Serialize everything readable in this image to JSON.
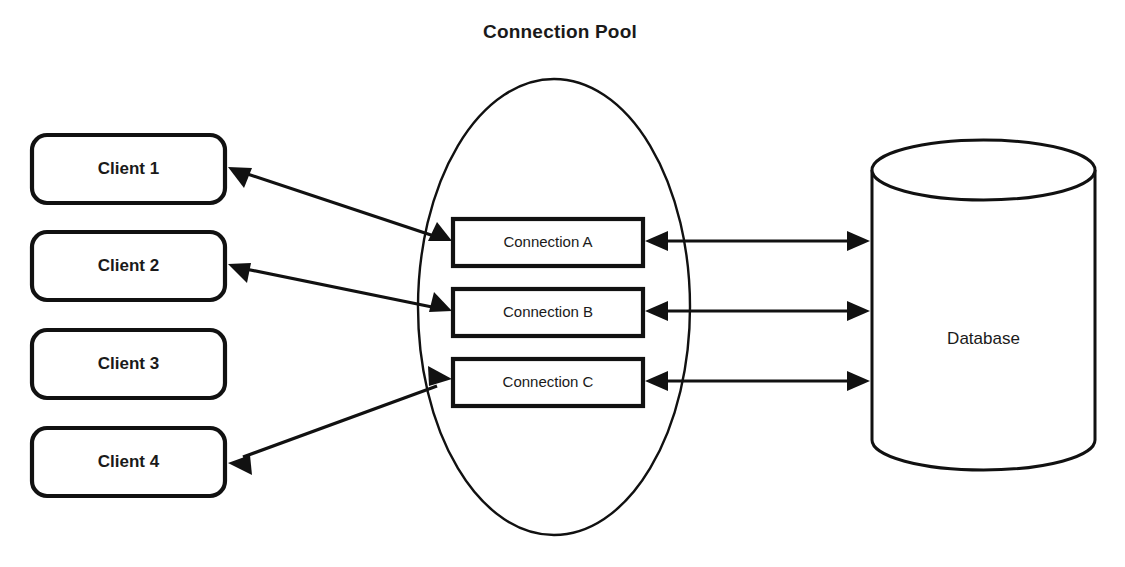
{
  "diagram": {
    "title": "Connection Pool",
    "title_position": {
      "x": 560,
      "y": 33
    },
    "canvas": {
      "width": 1125,
      "height": 567
    },
    "colors": {
      "background": "#ffffff",
      "stroke": "#111111",
      "text": "#1a1a1a"
    }
  },
  "clients": [
    {
      "label": "Client 1",
      "x": 32,
      "y": 135,
      "w": 193,
      "h": 68,
      "connected": true
    },
    {
      "label": "Client 2",
      "x": 32,
      "y": 232,
      "w": 193,
      "h": 68,
      "connected": true
    },
    {
      "label": "Client 3",
      "x": 32,
      "y": 330,
      "w": 193,
      "h": 68,
      "connected": false
    },
    {
      "label": "Client 4",
      "x": 32,
      "y": 428,
      "w": 193,
      "h": 68,
      "connected": true
    }
  ],
  "pool": {
    "label": "Connection Pool",
    "shape": "ellipse",
    "cx": 554,
    "cy": 307,
    "rx": 136,
    "ry": 228
  },
  "connections": [
    {
      "label": "Connection A",
      "x": 453,
      "y": 219,
      "w": 190,
      "h": 47
    },
    {
      "label": "Connection B",
      "x": 453,
      "y": 289,
      "w": 190,
      "h": 47
    },
    {
      "label": "Connection C",
      "x": 453,
      "y": 359,
      "w": 190,
      "h": 47
    }
  ],
  "database": {
    "label": "Database",
    "shape": "cylinder",
    "x": 872,
    "y": 170,
    "w": 223,
    "h": 300,
    "ellipse_ry": 30
  },
  "client_links": [
    {
      "from": "Client 1",
      "to": "Connection A",
      "style": "double-arrow",
      "x1": 228,
      "y1": 168,
      "x2": 450,
      "y2": 241
    },
    {
      "from": "Client 2",
      "to": "Connection B",
      "style": "double-arrow",
      "x1": 228,
      "y1": 265,
      "x2": 450,
      "y2": 311
    },
    {
      "from": "Client 4",
      "to": "Connection C",
      "style": "double-arrow",
      "x1": 228,
      "y1": 462,
      "x2": 450,
      "y2": 381
    }
  ],
  "db_links": [
    {
      "from": "Connection A",
      "to": "Database",
      "style": "double-arrow",
      "x1": 646,
      "y1": 241,
      "x2": 869,
      "y2": 241
    },
    {
      "from": "Connection B",
      "to": "Database",
      "style": "double-arrow",
      "x1": 646,
      "y1": 311,
      "x2": 869,
      "y2": 311
    },
    {
      "from": "Connection C",
      "to": "Database",
      "style": "double-arrow",
      "x1": 646,
      "y1": 381,
      "x2": 869,
      "y2": 381
    }
  ]
}
